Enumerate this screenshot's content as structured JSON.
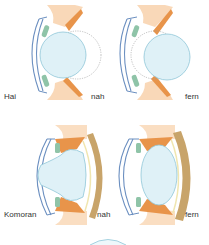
{
  "rows": [
    {
      "species_label": "Hai",
      "panels": [
        {
          "state_label": "nah",
          "mechanism": "lens-moves-forward"
        },
        {
          "state_label": "fern",
          "mechanism": "lens-moves-back"
        }
      ]
    },
    {
      "species_label": "Komoran",
      "panels": [
        {
          "state_label": "nah",
          "mechanism": "lens-deformed-forward"
        },
        {
          "state_label": "fern",
          "mechanism": "lens-relaxed"
        }
      ]
    }
  ],
  "colors": {
    "lens": "#dff1f7",
    "lens_stroke": "#8fc6d8",
    "cornea": "#6b8fc0",
    "muscle": "#e8944a",
    "muscle_light": "#f6c89a",
    "ciliary": "#8fc4a8",
    "sclera": "#c8a46a",
    "dotted": "#999999"
  }
}
